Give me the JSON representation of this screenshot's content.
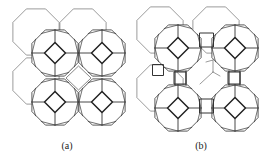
{
  "figure": {
    "panels": [
      {
        "id": "a",
        "label": "(a)",
        "description": "Sodalite cages packed directly sharing square faces"
      },
      {
        "id": "b",
        "label": "(b)",
        "description": "Sodalite cages linked through double four-rings (cubes)"
      }
    ],
    "line_color": "#333333",
    "back_line_color": "#555555"
  }
}
